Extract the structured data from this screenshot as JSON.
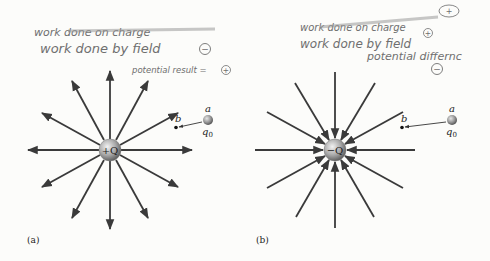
{
  "annotations": {
    "left": {
      "struck_text": "work done on charge",
      "line1": "work done by field",
      "line1_sign": "−",
      "line2": "potential result = ",
      "line2_sign": "+"
    },
    "right": {
      "struck_text": "work done on charge",
      "struck_sign": "+",
      "line1": "work done by field",
      "line1_sign": "+",
      "line2": "potential differnc",
      "line2_sign": "−"
    }
  },
  "panels": [
    {
      "id": "a",
      "caption": "(a)",
      "charge_label": "+Q",
      "field_direction": "outward",
      "point_a_label": "a",
      "point_b_label": "b",
      "test_charge_label": "q",
      "test_charge_subscript": "0"
    },
    {
      "id": "b",
      "caption": "(b)",
      "charge_label": "−Q",
      "field_direction": "inward",
      "point_a_label": "a",
      "point_b_label": "b",
      "test_charge_label": "q",
      "test_charge_subscript": "0"
    }
  ],
  "colors": {
    "field_line": "#3a3a3a",
    "sphere_light": "#e8e8e8",
    "sphere_dark": "#6a6a6a",
    "handwriting": "#6f6f6f"
  }
}
